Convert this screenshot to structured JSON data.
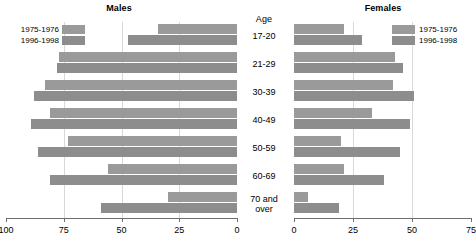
{
  "chart_data": {
    "type": "bar",
    "title": "",
    "orientation": "horizontal",
    "layout": "population-pyramid",
    "categories": [
      "17-20",
      "21-29",
      "30-39",
      "40-49",
      "50-59",
      "60-69",
      "70 and over"
    ],
    "category_axis_label": "Age",
    "grid": true,
    "legend_position": "top-inside",
    "panels": [
      {
        "name": "Males",
        "direction": "left",
        "xlabel": "",
        "ylabel": "",
        "xlim": [
          100,
          0
        ],
        "ticks": [
          100,
          75,
          50,
          25,
          0
        ],
        "tick_labels": [
          "100",
          "75",
          "50",
          "25",
          "0"
        ],
        "series": [
          {
            "name": "1975-1976",
            "color": "#9a9a9a",
            "values": [
              34,
              77,
              83,
              81,
              73,
              56,
              30
            ]
          },
          {
            "name": "1996-1998",
            "color": "#8d8d8d",
            "values": [
              47,
              78,
              88,
              89,
              86,
              81,
              59
            ]
          }
        ]
      },
      {
        "name": "Females",
        "direction": "right",
        "xlabel": "",
        "ylabel": "",
        "xlim": [
          0,
          75
        ],
        "ticks": [
          0,
          25,
          50,
          75
        ],
        "tick_labels": [
          "0",
          "25",
          "50",
          "75"
        ],
        "series": [
          {
            "name": "1975-1976",
            "color": "#9a9a9a",
            "values": [
              21,
              43,
              42,
              33,
              20,
              21,
              6
            ]
          },
          {
            "name": "1996-1998",
            "color": "#8d8d8d",
            "values": [
              29,
              46,
              51,
              49,
              45,
              38,
              19
            ]
          }
        ]
      }
    ]
  },
  "males": {
    "title": "Males",
    "legend": [
      {
        "label": "1975-1976"
      },
      {
        "label": "1996-1998"
      }
    ]
  },
  "females": {
    "title": "Females",
    "legend": [
      {
        "label": "1975-1976"
      },
      {
        "label": "1996-1998"
      }
    ]
  },
  "age": {
    "title": "Age",
    "labels": [
      "17-20",
      "21-29",
      "30-39",
      "40-49",
      "50-59",
      "60-69",
      "70 and over"
    ]
  }
}
